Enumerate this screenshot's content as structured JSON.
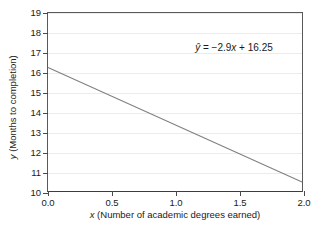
{
  "chart_data": {
    "type": "line",
    "title": "",
    "xlabel": "x (Number of academic degrees earned)",
    "ylabel": "y (Months to completion)",
    "xlabel_italic_symbol": "x",
    "xlabel_rest": " (Number of academic degrees earned)",
    "ylabel_italic_symbol": "y",
    "ylabel_rest": " (Months to completion)",
    "xlim": [
      0.0,
      2.0
    ],
    "ylim": [
      10,
      19
    ],
    "xticks": [
      0.0,
      0.5,
      1.0,
      1.5,
      2.0
    ],
    "xtick_labels": [
      "0.0",
      "0.5",
      "1.0",
      "1.5",
      "2.0"
    ],
    "yticks": [
      10,
      11,
      12,
      13,
      14,
      15,
      16,
      17,
      18,
      19
    ],
    "ytick_labels": [
      "10",
      "11",
      "12",
      "13",
      "14",
      "15",
      "16",
      "17",
      "18",
      "19"
    ],
    "grid": "horizontal",
    "grid_color": "#ececec",
    "legend": "none",
    "series": [
      {
        "name": "regression-line",
        "color": "#808080",
        "equation": "y-hat = -2.9x + 16.25",
        "slope": -2.9,
        "intercept": 16.25,
        "x": [
          0.0,
          2.0
        ],
        "values": [
          16.25,
          10.45
        ]
      }
    ],
    "annotations": [
      {
        "name": "regression-equation",
        "text": "ŷ = −2.9x + 16.25",
        "parts": {
          "yhat": "ŷ",
          "equals": " = −2.9",
          "x_symbol": "x",
          "tail": " + 16.25"
        },
        "x": 1.15,
        "y": 17.5
      }
    ]
  },
  "colors": {
    "axis": "#4a4a4a",
    "frame": "#595959",
    "baseline": "#3d3d3d",
    "grid": "#ececec",
    "line": "#808080",
    "text": "#1a1a1a",
    "background": "#ffffff"
  }
}
